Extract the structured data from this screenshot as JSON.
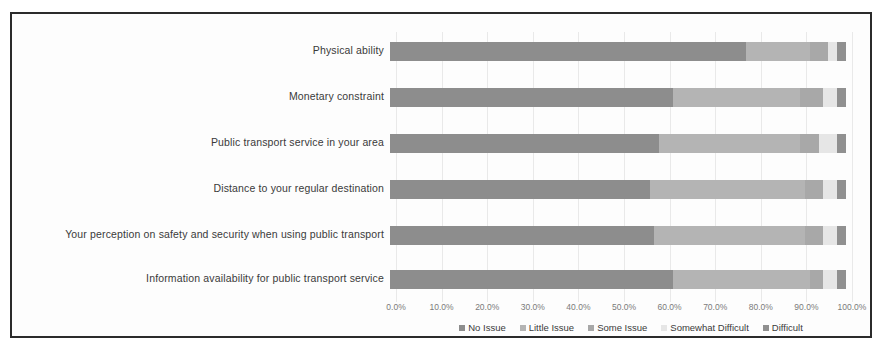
{
  "chart_data": {
    "type": "bar",
    "orientation": "horizontal",
    "stacked": true,
    "normalized": "100%",
    "title": "",
    "subtitle": "",
    "xlabel": "",
    "ylabel": "",
    "xlim": [
      0,
      100
    ],
    "xtick_labels": [
      "0.0%",
      "10.0%",
      "20.0%",
      "30.0%",
      "40.0%",
      "50.0%",
      "60.0%",
      "70.0%",
      "80.0%",
      "90.0%",
      "100.0%"
    ],
    "xtick_values": [
      0,
      10,
      20,
      30,
      40,
      50,
      60,
      70,
      80,
      90,
      100
    ],
    "grid": true,
    "grid_axis": "x",
    "legend_position": "bottom",
    "categories": [
      "Physical ability",
      "Monetary constraint",
      "Public transport service in your area",
      "Distance to your regular destination",
      "Your perception on safety and security when using public transport",
      "Information availability for public transport service"
    ],
    "series": [
      {
        "name": "No Issue",
        "color": "#8d8d8d",
        "values": [
          78,
          62,
          59,
          57,
          58,
          62
        ]
      },
      {
        "name": "Little Issue",
        "color": "#b4b4b4",
        "values": [
          14,
          28,
          31,
          34,
          33,
          30
        ]
      },
      {
        "name": "Some Issue",
        "color": "#a8a8a8",
        "values": [
          4,
          5,
          4,
          4,
          4,
          3
        ]
      },
      {
        "name": "Somewhat Difficult",
        "color": "#e6e6e6",
        "values": [
          2,
          3,
          4,
          3,
          3,
          3
        ]
      },
      {
        "name": "Difficult",
        "color": "#909090",
        "values": [
          2,
          2,
          2,
          2,
          2,
          2
        ]
      }
    ]
  }
}
